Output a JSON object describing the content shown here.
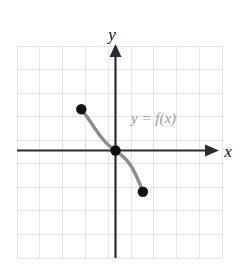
{
  "figure": {
    "name": "function-graph",
    "background_color": "#ffffff",
    "grid_color": "#e2e2e4",
    "axis_color": "#2b2b2f",
    "curve_color": "#8c8c90",
    "point_color": "#111111",
    "label_color_axis": "#111111",
    "label_color_curve": "#9a9a9a"
  },
  "labels": {
    "y_axis": "y",
    "x_axis": "x",
    "curve": "y = f(x)",
    "curve_y": "y",
    "curve_equals": "=",
    "curve_fx": "f(x)"
  },
  "chart_data": {
    "type": "line",
    "title": "",
    "xlabel": "x",
    "ylabel": "y",
    "grid": true,
    "legend": "none",
    "xlim": [
      -4.3,
      4.6
    ],
    "ylim": [
      -4.7,
      4.5
    ],
    "xticks": [
      -4,
      -3,
      -2,
      -1,
      0,
      1,
      2,
      3,
      4
    ],
    "yticks": [
      -4,
      -3,
      -2,
      -1,
      0,
      1,
      2,
      3,
      4
    ],
    "tick_labels_shown": false,
    "series": [
      {
        "name": "y = f(x)",
        "annotation": "y = f(x)",
        "color": "#8c8c90",
        "style": "solid",
        "x": [
          -1.5,
          -1.3,
          -1.1,
          -0.9,
          -0.7,
          -0.5,
          -0.3,
          -0.15,
          0.0,
          0.15,
          0.3,
          0.5,
          0.7,
          0.9,
          1.05,
          1.2
        ],
        "y": [
          1.75,
          1.5,
          1.22,
          0.93,
          0.66,
          0.42,
          0.22,
          0.1,
          0.0,
          -0.11,
          -0.23,
          -0.42,
          -0.68,
          -1.05,
          -1.38,
          -1.75
        ]
      }
    ],
    "points": [
      {
        "label": "left-endpoint",
        "x": -1.5,
        "y": 1.75,
        "filled": true
      },
      {
        "label": "origin-point",
        "x": 0.0,
        "y": 0.0,
        "filled": true
      },
      {
        "label": "right-endpoint",
        "x": 1.2,
        "y": -1.75,
        "filled": true
      }
    ]
  }
}
